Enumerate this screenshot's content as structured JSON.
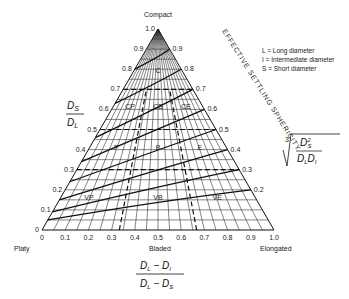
{
  "diagram": {
    "type": "ternary-form-diagram",
    "vertices": {
      "top": "Compact",
      "left": "Platy",
      "bottom_middle": "Bladed",
      "right": "Elongated"
    },
    "left_axis": {
      "label_num": "D",
      "label_num_sub": "S",
      "label_den": "D",
      "label_den_sub": "L",
      "ticks": [
        "0",
        "0.1",
        "0.2",
        "0.3",
        "0.4",
        "0.5",
        "0.6",
        "0.7",
        "0.8",
        "0.9",
        "1.0"
      ]
    },
    "bottom_axis": {
      "label_num": "Dₗ − Dᵢ",
      "label_den": "Dₗ − Dₛ",
      "ticks": [
        "0",
        "0.1",
        "0.2",
        "0.3",
        "0.4",
        "0.5",
        "0.6",
        "0.7",
        "0.8",
        "0.9",
        "1.0"
      ]
    },
    "right_axis": {
      "title": "EFFECTIVE SETTLING SPHERICITY",
      "formula": "∛(Dₛ² / DₗDᵢ)",
      "ticks": [
        "0.9",
        "0.8",
        "0.7",
        "0.6",
        "0.5",
        "0.4",
        "0.3",
        "0.2"
      ]
    },
    "classes": [
      "C",
      "CP",
      "CB",
      "CE",
      "P",
      "B",
      "E",
      "VP",
      "VB",
      "VE"
    ],
    "legend": [
      {
        "symbol": "L",
        "text": "Long diameter"
      },
      {
        "symbol": "I",
        "text": "Intermediate diameter"
      },
      {
        "symbol": "S",
        "text": "Short diameter"
      }
    ]
  }
}
